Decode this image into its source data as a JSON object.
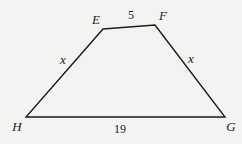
{
  "diagram": {
    "shape": "isosceles trapezoid",
    "vertices": [
      {
        "name": "E",
        "x": 103,
        "y": 29,
        "label_x": 96,
        "label_y": 24
      },
      {
        "name": "F",
        "x": 155,
        "y": 25,
        "label_x": 163,
        "label_y": 20
      },
      {
        "name": "G",
        "x": 225,
        "y": 117,
        "label_x": 231,
        "label_y": 131
      },
      {
        "name": "H",
        "x": 26,
        "y": 117,
        "label_x": 17,
        "label_y": 131
      }
    ],
    "sides": {
      "EF": {
        "label": "5",
        "x": 131,
        "y": 19
      },
      "FG": {
        "label": "x",
        "x": 191,
        "y": 63
      },
      "GH": {
        "label": "19",
        "x": 120,
        "y": 133
      },
      "HE": {
        "label": "x",
        "x": 63,
        "y": 64
      }
    },
    "stroke_color": "#1a1a1a",
    "background_color": "#f3f3f1"
  }
}
